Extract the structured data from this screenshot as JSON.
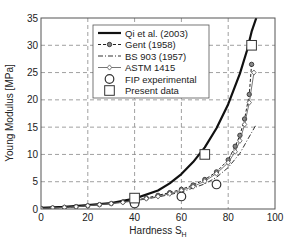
{
  "chart_data": {
    "type": "line",
    "title": "",
    "xlabel": "Hardness S",
    "xlabel_sub": "H",
    "ylabel": "Young Modulus [MPa]",
    "xlim": [
      0,
      100
    ],
    "ylim": [
      0,
      35
    ],
    "xticks": [
      0,
      20,
      40,
      60,
      80,
      100
    ],
    "yticks": [
      0,
      5,
      10,
      15,
      20,
      25,
      30,
      35
    ],
    "grid": true,
    "legend_position": "upper-center",
    "series": [
      {
        "name": "Qi et al. (2003)",
        "style": "thick-solid",
        "x": [
          0,
          10,
          20,
          30,
          40,
          50,
          55,
          60,
          65,
          70,
          75,
          80,
          85,
          88,
          90,
          92
        ],
        "y": [
          0.2,
          0.4,
          0.7,
          1.1,
          1.9,
          3.4,
          4.7,
          6.4,
          8.6,
          11.3,
          14.8,
          19.2,
          24.8,
          29.0,
          32.5,
          35.0
        ]
      },
      {
        "name": "Gent (1958)",
        "style": "dashed-circle-markers",
        "x": [
          0,
          5,
          10,
          15,
          20,
          25,
          30,
          35,
          40,
          45,
          50,
          55,
          60,
          65,
          70,
          75,
          80,
          83,
          85,
          87,
          89,
          90
        ],
        "y": [
          0.1,
          0.2,
          0.3,
          0.45,
          0.6,
          0.8,
          1.0,
          1.3,
          1.6,
          2.0,
          2.5,
          3.0,
          3.6,
          4.4,
          5.4,
          6.8,
          9.0,
          11.5,
          13.5,
          16.5,
          21.0,
          26.5
        ]
      },
      {
        "name": "BS 903 (1957)",
        "style": "dash-dot",
        "x": [
          0,
          10,
          20,
          30,
          40,
          50,
          60,
          70,
          75,
          80,
          85,
          88,
          90,
          92
        ],
        "y": [
          0.1,
          0.3,
          0.6,
          1.0,
          1.5,
          2.2,
          3.1,
          4.6,
          5.8,
          7.6,
          10.2,
          12.5,
          14.0,
          15.5
        ]
      },
      {
        "name": "ASTM 1415",
        "style": "solid-diamond-markers",
        "x": [
          0,
          5,
          10,
          15,
          20,
          25,
          30,
          35,
          40,
          45,
          50,
          55,
          60,
          65,
          70,
          75,
          80,
          83,
          85,
          87,
          89,
          91
        ],
        "y": [
          0.1,
          0.2,
          0.3,
          0.4,
          0.6,
          0.8,
          1.0,
          1.2,
          1.5,
          1.9,
          2.3,
          2.8,
          3.4,
          4.1,
          5.1,
          6.5,
          8.5,
          10.5,
          12.5,
          15.5,
          19.5,
          25.0
        ]
      },
      {
        "name": "FIP experimental",
        "style": "circle-markers",
        "x": [
          40,
          60,
          75
        ],
        "y": [
          1.0,
          2.3,
          4.5
        ]
      },
      {
        "name": "Present data",
        "style": "square-markers",
        "x": [
          40,
          70,
          90
        ],
        "y": [
          2.0,
          10.0,
          30.0
        ]
      }
    ]
  },
  "legend": {
    "items": [
      {
        "label": "Qi et al. (2003)"
      },
      {
        "label": "Gent (1958)"
      },
      {
        "label": "BS 903 (1957)"
      },
      {
        "label": "ASTM 1415"
      },
      {
        "label": "FIP experimental"
      },
      {
        "label": "Present data"
      }
    ]
  },
  "colors": {
    "line": "#111111",
    "grid": "#888888",
    "axis": "#555555",
    "thin_line": "#666666"
  }
}
